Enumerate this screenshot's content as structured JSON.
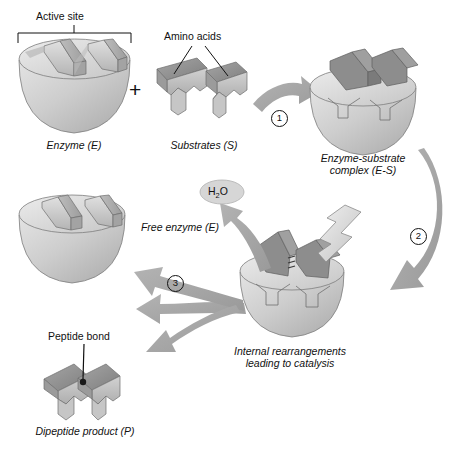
{
  "diagram": {
    "background": "#ffffff",
    "palette": {
      "enzyme_light": "#d9d9d9",
      "enzyme_mid": "#c4c4c4",
      "enzyme_dark": "#ababab",
      "substrate_dark": "#8f8f8f",
      "substrate_mid": "#a8a8a8",
      "substrate_light": "#cfcfcf",
      "arrow_gray": "#a6a6a6",
      "outline": "#6e6e6e",
      "text": "#111111"
    }
  },
  "annotations": {
    "active_site": "Active site",
    "amino_acids": "Amino acids",
    "peptide_bond": "Peptide bond",
    "water_molecule": "H",
    "water_sub": "2",
    "water_tail": "O"
  },
  "stages": {
    "enzyme": "Enzyme (E)",
    "substrates": "Substrates (S)",
    "complex_line1": "Enzyme-substrate",
    "complex_line2": "complex (E-S)",
    "catalysis_line1": "Internal rearrangements",
    "catalysis_line2": "leading to catalysis",
    "free_enzyme": "Free enzyme (E)",
    "product": "Dipeptide product (P)"
  },
  "steps": {
    "one": "1",
    "two": "2",
    "three": "3"
  },
  "operators": {
    "plus": "+"
  }
}
